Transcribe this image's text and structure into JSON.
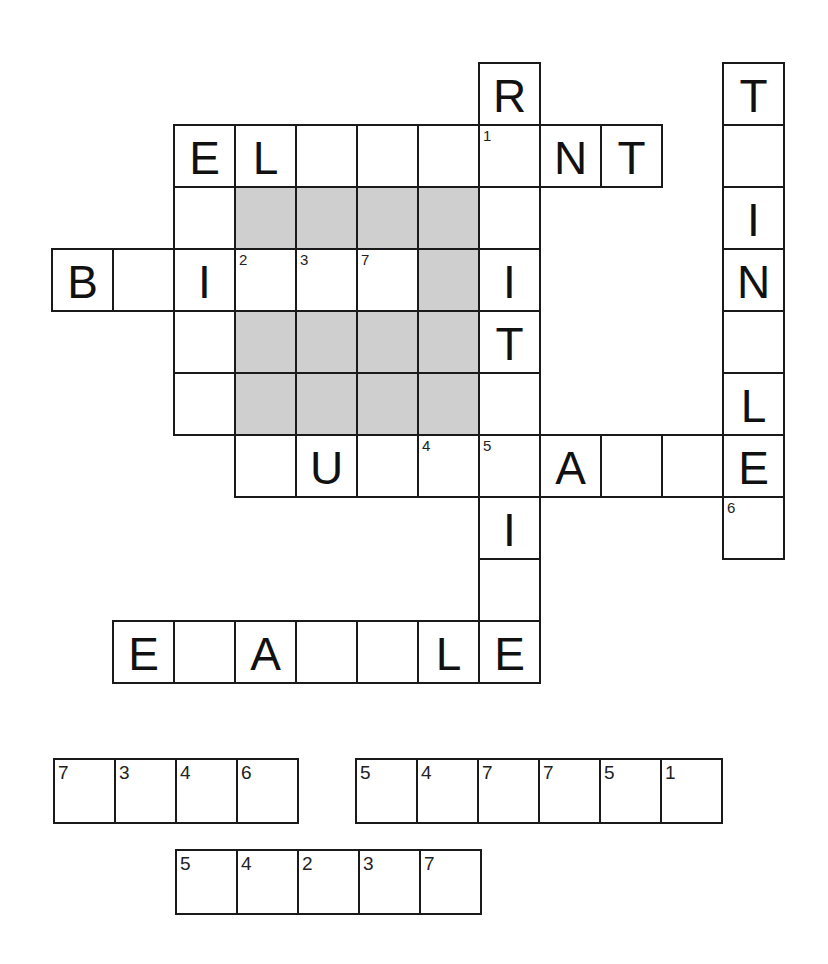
{
  "puzzle": {
    "type": "crossword-with-code-words",
    "colors": {
      "line": "#1a1a1a",
      "shaded": "#cfcfcf",
      "cell": "#ffffff"
    },
    "grid": {
      "origin_x": 51,
      "origin_y": 62,
      "cell_w": 61,
      "cell_h": 62,
      "cells": [
        {
          "r": 0,
          "c": 7,
          "letter": "R"
        },
        {
          "r": 0,
          "c": 11,
          "letter": "T"
        },
        {
          "r": 1,
          "c": 2,
          "letter": "E"
        },
        {
          "r": 1,
          "c": 3,
          "letter": "L"
        },
        {
          "r": 1,
          "c": 4,
          "letter": ""
        },
        {
          "r": 1,
          "c": 5,
          "letter": ""
        },
        {
          "r": 1,
          "c": 6,
          "letter": ""
        },
        {
          "r": 1,
          "c": 7,
          "letter": "",
          "num": "1"
        },
        {
          "r": 1,
          "c": 8,
          "letter": "N"
        },
        {
          "r": 1,
          "c": 9,
          "letter": "T"
        },
        {
          "r": 1,
          "c": 11,
          "letter": ""
        },
        {
          "r": 2,
          "c": 2,
          "letter": ""
        },
        {
          "r": 2,
          "c": 3,
          "shaded": true
        },
        {
          "r": 2,
          "c": 4,
          "shaded": true
        },
        {
          "r": 2,
          "c": 5,
          "shaded": true
        },
        {
          "r": 2,
          "c": 6,
          "shaded": true
        },
        {
          "r": 2,
          "c": 7,
          "letter": ""
        },
        {
          "r": 2,
          "c": 11,
          "letter": "I"
        },
        {
          "r": 3,
          "c": 0,
          "letter": "B"
        },
        {
          "r": 3,
          "c": 1,
          "letter": ""
        },
        {
          "r": 3,
          "c": 2,
          "letter": "I"
        },
        {
          "r": 3,
          "c": 3,
          "letter": "",
          "num": "2"
        },
        {
          "r": 3,
          "c": 4,
          "letter": "",
          "num": "3"
        },
        {
          "r": 3,
          "c": 5,
          "letter": "",
          "num": "7"
        },
        {
          "r": 3,
          "c": 6,
          "shaded": true
        },
        {
          "r": 3,
          "c": 7,
          "letter": "I"
        },
        {
          "r": 3,
          "c": 11,
          "letter": "N"
        },
        {
          "r": 4,
          "c": 2,
          "letter": ""
        },
        {
          "r": 4,
          "c": 3,
          "shaded": true
        },
        {
          "r": 4,
          "c": 4,
          "shaded": true
        },
        {
          "r": 4,
          "c": 5,
          "shaded": true
        },
        {
          "r": 4,
          "c": 6,
          "shaded": true
        },
        {
          "r": 4,
          "c": 7,
          "letter": "T"
        },
        {
          "r": 4,
          "c": 11,
          "letter": ""
        },
        {
          "r": 5,
          "c": 2,
          "letter": ""
        },
        {
          "r": 5,
          "c": 3,
          "shaded": true
        },
        {
          "r": 5,
          "c": 4,
          "shaded": true
        },
        {
          "r": 5,
          "c": 5,
          "shaded": true
        },
        {
          "r": 5,
          "c": 6,
          "shaded": true
        },
        {
          "r": 5,
          "c": 7,
          "letter": ""
        },
        {
          "r": 5,
          "c": 11,
          "letter": "L"
        },
        {
          "r": 6,
          "c": 3,
          "letter": ""
        },
        {
          "r": 6,
          "c": 4,
          "letter": "U"
        },
        {
          "r": 6,
          "c": 5,
          "letter": ""
        },
        {
          "r": 6,
          "c": 6,
          "letter": "",
          "num": "4"
        },
        {
          "r": 6,
          "c": 7,
          "letter": "",
          "num": "5"
        },
        {
          "r": 6,
          "c": 8,
          "letter": "A"
        },
        {
          "r": 6,
          "c": 9,
          "letter": ""
        },
        {
          "r": 6,
          "c": 10,
          "letter": ""
        },
        {
          "r": 6,
          "c": 11,
          "letter": "E"
        },
        {
          "r": 7,
          "c": 7,
          "letter": "I"
        },
        {
          "r": 7,
          "c": 11,
          "letter": "",
          "num": "6"
        },
        {
          "r": 8,
          "c": 7,
          "letter": ""
        },
        {
          "r": 9,
          "c": 1,
          "letter": "E"
        },
        {
          "r": 9,
          "c": 2,
          "letter": ""
        },
        {
          "r": 9,
          "c": 3,
          "letter": "A"
        },
        {
          "r": 9,
          "c": 4,
          "letter": ""
        },
        {
          "r": 9,
          "c": 5,
          "letter": ""
        },
        {
          "r": 9,
          "c": 6,
          "letter": "L"
        },
        {
          "r": 9,
          "c": 7,
          "letter": "E"
        }
      ]
    },
    "code_words": [
      {
        "x": 53,
        "y": 758,
        "cell_w": 61,
        "cell_h": 66,
        "numbers": [
          "7",
          "3",
          "4",
          "6"
        ]
      },
      {
        "x": 355,
        "y": 758,
        "cell_w": 61,
        "cell_h": 66,
        "numbers": [
          "5",
          "4",
          "7",
          "7",
          "5",
          "1"
        ]
      },
      {
        "x": 175,
        "y": 849,
        "cell_w": 61,
        "cell_h": 66,
        "numbers": [
          "5",
          "4",
          "2",
          "3",
          "7"
        ]
      }
    ]
  }
}
